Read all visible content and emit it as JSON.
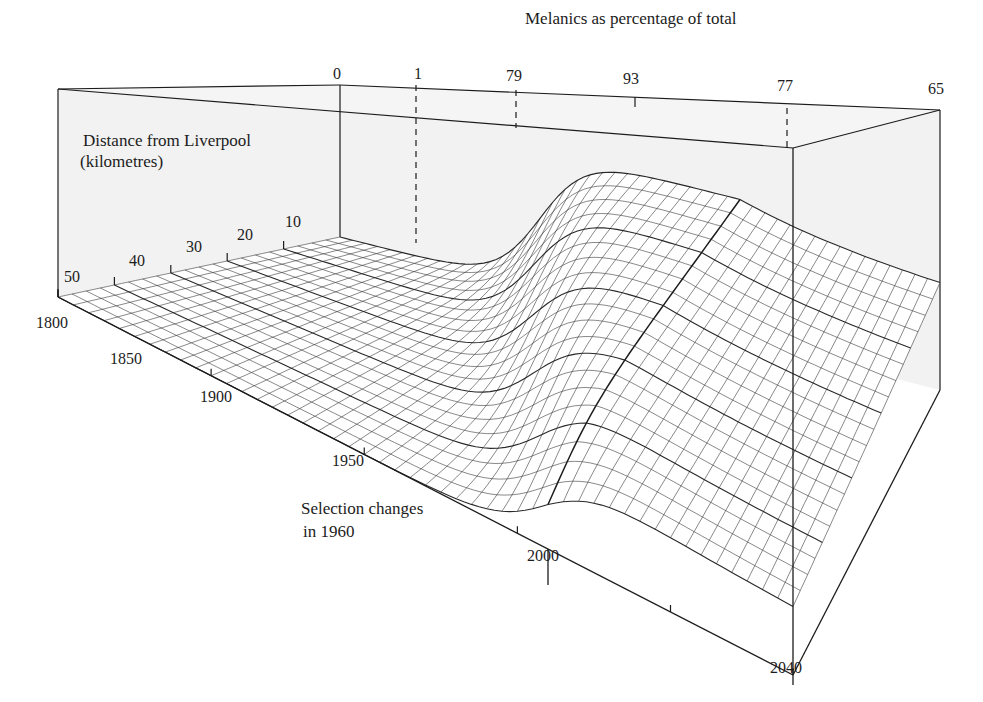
{
  "figure": {
    "top_label": "Melanics as percentage of total",
    "depth_axis_label_line1": "Distance from Liverpool",
    "depth_axis_label_line2": "(kilometres)",
    "annotation_line1": "Selection changes",
    "annotation_line2": "in 1960",
    "colors": {
      "ink": "#1c1c1c",
      "back_panel": "#f2f2f2",
      "surface_fill": "#ffffff"
    }
  },
  "chart_data": {
    "type": "surface",
    "title": "Melanics as percentage of total",
    "x_axis": {
      "label": "Year",
      "ticks": [
        "1800",
        "1850",
        "1900",
        "1950",
        "2000",
        "2040"
      ],
      "range": [
        1800,
        2040
      ]
    },
    "y_axis": {
      "label": "Distance from Liverpool (kilometres)",
      "ticks": [
        "50",
        "40",
        "30",
        "20",
        "10"
      ],
      "range": [
        0,
        50
      ]
    },
    "z_axis": {
      "label": "Melanics as percentage of total",
      "range": [
        0,
        100
      ]
    },
    "annotation": {
      "year": 1960,
      "text": "Selection changes in 1960"
    },
    "top_edge_values": {
      "description": "Melanic percentage at Liverpool (0 km) at successive years, marked along the top edge",
      "labels": [
        "0",
        "1",
        "79",
        "93",
        "77",
        "65"
      ],
      "years": [
        1800,
        1850,
        1900,
        1960,
        2000,
        2040
      ]
    },
    "grid": true
  }
}
